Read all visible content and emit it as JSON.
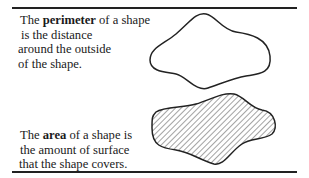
{
  "perimeter": {
    "lines": [
      {
        "pre": "The ",
        "bold": "perimeter",
        "post": " of a shape"
      },
      {
        "pre": "is the distance",
        "bold": "",
        "post": ""
      },
      {
        "pre": "around the outside",
        "bold": "",
        "post": ""
      },
      {
        "pre": "of the shape.",
        "bold": "",
        "post": ""
      }
    ],
    "shape_style": "outline"
  },
  "area": {
    "lines": [
      {
        "pre": "The ",
        "bold": "area",
        "post": " of a shape is"
      },
      {
        "pre": "the amount of surface",
        "bold": "",
        "post": ""
      },
      {
        "pre": "that the shape covers.",
        "bold": "",
        "post": ""
      }
    ],
    "shape_style": "hatched"
  },
  "colors": {
    "ink": "#222222",
    "background": "#ffffff"
  }
}
